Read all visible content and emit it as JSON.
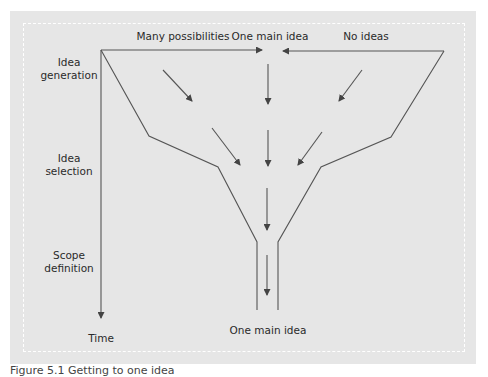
{
  "diagram": {
    "title_labels": {
      "many_possibilities": "Many possibilities",
      "one_main_idea_top": "One main idea",
      "no_ideas": "No ideas"
    },
    "stages": [
      {
        "line1": "Idea",
        "line2": "generation"
      },
      {
        "line1": "Idea",
        "line2": "selection"
      },
      {
        "line1": "Scope",
        "line2": "definition"
      }
    ],
    "axis_label": "Time",
    "outcome_label": "One main idea",
    "colors": {
      "panel_background": "#e6e6e6",
      "line": "#555555",
      "dashed_border": "#ffffff"
    }
  },
  "caption": "Figure 5.1  Getting to one idea"
}
